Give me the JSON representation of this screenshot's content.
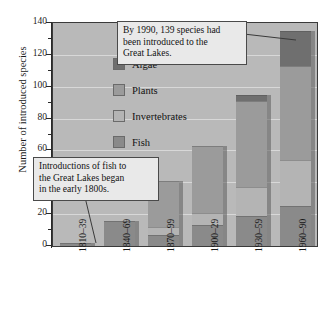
{
  "chart_data": {
    "type": "bar",
    "subtype": "stacked-bar",
    "title": "",
    "xlabel": "",
    "ylabel": "Number of introduced species",
    "ylim": [
      0,
      140
    ],
    "ytick_step": 20,
    "yminor_step": 10,
    "ytick_labels": [
      "0",
      "20",
      "40",
      "60",
      "80",
      "100",
      "120",
      "140"
    ],
    "grid": true,
    "legend_position": "inside-top-left",
    "categories": [
      "1810–39",
      "1840–69",
      "1870–99",
      "1900–29",
      "1930–59",
      "1960–90"
    ],
    "series": [
      {
        "name": "Fish",
        "color": "#8a8a8a",
        "values": [
          2,
          16,
          7,
          13,
          19,
          25
        ]
      },
      {
        "name": "Invertebrates",
        "color": "#b4b4b4",
        "values": [
          0,
          0,
          5,
          8,
          18,
          29
        ]
      },
      {
        "name": "Plants",
        "color": "#9b9b9b",
        "values": [
          0,
          0,
          29,
          42,
          54,
          59
        ]
      },
      {
        "name": "Algae",
        "color": "#6f6f6f",
        "values": [
          0,
          0,
          0,
          0,
          4,
          22
        ]
      }
    ],
    "totals": [
      2,
      16,
      41,
      63,
      95,
      135
    ],
    "annotations": [
      {
        "id": "callout-1990",
        "text": "By 1990, 139 species had been introduced to the Great Lakes."
      },
      {
        "id": "callout-fish",
        "text": "Introductions of fish to the Great Lakes began in the early 1800s."
      }
    ]
  },
  "legend": {
    "items": [
      {
        "label": "Algae",
        "color": "#6f6f6f"
      },
      {
        "label": "Plants",
        "color": "#9b9b9b"
      },
      {
        "label": "Invertebrates",
        "color": "#b4b4b4"
      },
      {
        "label": "Fish",
        "color": "#8a8a8a"
      }
    ]
  },
  "callouts": {
    "top": {
      "line1": "By 1990, 139 species had",
      "line2": "been introduced to the",
      "line3": "Great Lakes."
    },
    "bottom": {
      "line1": "Introductions of fish to",
      "line2": "the Great Lakes began",
      "line3": "in the early 1800s."
    }
  },
  "axes": {
    "y_title": "Number of introduced species"
  },
  "colors": {
    "plot_background": "#b9b9b9",
    "gridline": "#d8d8d8",
    "axis": "#2a2a2a",
    "callout_background": "#e9e9e9",
    "callout_border": "#4a4a4a"
  }
}
